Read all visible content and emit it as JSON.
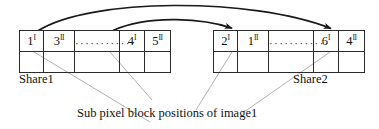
{
  "diagram": {
    "caption": "Sub pixel block positions of image1",
    "shares": [
      {
        "id": "share1",
        "label": "Share1",
        "cells": [
          {
            "value": "1",
            "sup": "I"
          },
          {
            "value": "3",
            "sup": "II"
          },
          {
            "value": "",
            "sup": "",
            "dots": "············"
          },
          {
            "value": "4",
            "sup": "I"
          },
          {
            "value": "5",
            "sup": "II"
          }
        ],
        "empty_row_cells": 5
      },
      {
        "id": "share2",
        "label": "Share2",
        "cells": [
          {
            "value": "2",
            "sup": "I"
          },
          {
            "value": "1",
            "sup": "II"
          },
          {
            "value": "",
            "sup": "",
            "dots": "············"
          },
          {
            "value": "6",
            "sup": "I"
          },
          {
            "value": "4",
            "sup": "II"
          }
        ],
        "empty_row_cells": 5
      }
    ],
    "arrows": [
      {
        "name": "arrow-share1-cell1-to-share2-cell4",
        "from": "Share1 cell 1",
        "to": "Share2 cell 4"
      },
      {
        "name": "arrow-share1-cell4-to-share2-cell1",
        "from": "Share1 cell 4",
        "to": "Share2 cell 1"
      }
    ],
    "leader_lines": 4,
    "colors": {
      "stroke": "#1a1a1a",
      "text": "#111111",
      "leader": "#8a8a8a",
      "background": "#ffffff"
    }
  }
}
